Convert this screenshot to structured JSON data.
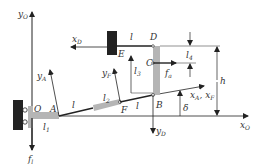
{
  "diagram": {
    "type": "mechanism-schematic",
    "colors": {
      "line": "#222222",
      "link_gray": "#b5b5b5",
      "wall": "#222222",
      "bg": "#ffffff"
    },
    "axes": {
      "yO": {
        "label": "y",
        "sub": "O"
      },
      "xO": {
        "label": "x",
        "sub": "O"
      },
      "xD": {
        "label": "x",
        "sub": "D"
      },
      "yD": {
        "label": "y",
        "sub": "D"
      },
      "yA": {
        "label": "y",
        "sub": "A"
      },
      "yF": {
        "label": "y",
        "sub": "F"
      },
      "xAF": {
        "label": "x",
        "sub": "A",
        "label2": ", x",
        "sub2": "F"
      }
    },
    "points": {
      "O": "O",
      "A": "A",
      "F": "F",
      "B": "B",
      "C": "C",
      "D": "D",
      "E": "E"
    },
    "dimensions": {
      "l_top": "l",
      "l_AF": "l",
      "l_FB": "l",
      "l1": {
        "label": "l",
        "sub": "1"
      },
      "l2": {
        "label": "l",
        "sub": "2"
      },
      "l3": {
        "label": "l",
        "sub": "3"
      },
      "l4": {
        "label": "l",
        "sub": "4"
      },
      "h": "h",
      "delta": "δ"
    },
    "forces": {
      "fa": {
        "label": "f",
        "sub": "a"
      },
      "fl": {
        "label": "f",
        "sub": "l"
      }
    }
  }
}
